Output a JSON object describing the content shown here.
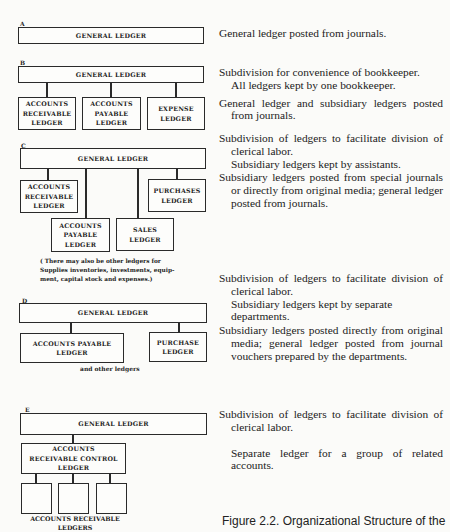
{
  "sections": {
    "a": {
      "label": "A",
      "general_ledger": "GENERAL LEDGER",
      "descriptions": [
        "General ledger posted from journals."
      ]
    },
    "b": {
      "label": "B",
      "general_ledger": "GENERAL LEDGER",
      "children": [
        "ACCOUNTS\nRECEIVABLE\nLEDGER",
        "ACCOUNTS\nPAYABLE\nLEDGER",
        "EXPENSE\nLEDGER"
      ],
      "descriptions": [
        "Subdivision for convenience of bookkeeper.",
        "All ledgers kept by one bookkeeper.",
        "General ledger and subsidiary ledgers posted from journals."
      ]
    },
    "c": {
      "label": "C",
      "general_ledger": "GENERAL LEDGER",
      "children": [
        "ACCOUNTS\nRECEIVABLE\nLEDGER",
        "ACCOUNTS\nPAYABLE\nLEDGER",
        "SALES\nLEDGER",
        "PURCHASES\nLEDGER"
      ],
      "note": "( There may also be other ledgers for Supplies inventories, investments, equip-ment, capital stock and expenses.)",
      "descriptions": [
        "Subdivision of ledgers to facilitate division of clerical labor.",
        "Subsidiary ledgers kept by assistants.",
        "Subsidiary ledgers posted from special journals or directly from original media; general ledger posted from journals."
      ]
    },
    "d": {
      "label": "D",
      "general_ledger": "GENERAL LEDGER",
      "children": [
        "ACCOUNTS PAYABLE\nLEDGER",
        "PURCHASE\nLEDGER"
      ],
      "note": "and other ledgers",
      "descriptions": [
        "Subdivision of ledgers to facilitate division of clerical labor.",
        "Subsidiary ledgers kept by separate departments.",
        "Subsidiary ledgers posted directly from original media; general ledger posted from journal vouchers prepared by the departments."
      ]
    },
    "e": {
      "label": "E",
      "general_ledger": "GENERAL LEDGER",
      "control_ledger": "ACCOUNTS\nRECEIVABLE CONTROL\nLEDGER",
      "sub_ledgers_label": "ACCOUNTS RECEIVABLE\nLEDGERS",
      "descriptions": [
        "Subdivision of ledgers to facilitate division of clerical labor.",
        "Separate ledger for a group of related accounts."
      ]
    }
  },
  "caption": "Figure 2.2. Organizational Structure of the"
}
